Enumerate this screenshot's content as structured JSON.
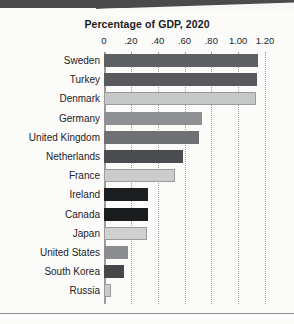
{
  "chart_data": {
    "type": "bar",
    "orientation": "horizontal",
    "title": "Percentage of GDP, 2020",
    "xlabel": "",
    "ylabel": "",
    "xlim": [
      0,
      1.2
    ],
    "grid": true,
    "legend": false,
    "tick_labels": [
      "0",
      ".20",
      ".40",
      ".60",
      ".80",
      "1.00",
      "1.20"
    ],
    "tick_values": [
      0,
      0.2,
      0.4,
      0.6,
      0.8,
      1.0,
      1.2
    ],
    "categories": [
      "Sweden",
      "Turkey",
      "Denmark",
      "Germany",
      "United Kingdom",
      "Netherlands",
      "France",
      "Ireland",
      "Canada",
      "Japan",
      "United States",
      "South Korea",
      "Russia"
    ],
    "values": [
      1.15,
      1.14,
      1.13,
      0.73,
      0.71,
      0.59,
      0.53,
      0.33,
      0.33,
      0.32,
      0.18,
      0.15,
      0.05
    ],
    "bar_colors": [
      "#5d5f62",
      "#58595c",
      "#c6c7c7",
      "#8e9093",
      "#6e7073",
      "#4a4c50",
      "#cbcccb",
      "#1d1e20",
      "#1b1c1e",
      "#cfd0cf",
      "#8b8d90",
      "#45474a",
      "#c9cac9"
    ]
  },
  "colors": {
    "axis": "#9b9b9b",
    "gridline": "#9a9a9a",
    "text": "#1f2226",
    "title": "#1c1c1c",
    "background": "#fbfbfa",
    "scan_edge": "#4a4a4a"
  }
}
